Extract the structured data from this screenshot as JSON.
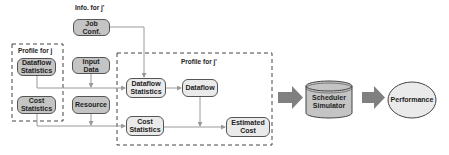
{
  "diagram": {
    "captions": {
      "info_for": "Info. for j'",
      "profile_for_j": "Profile for j",
      "profile_for_jprime": "Profile for j'"
    },
    "nodes": {
      "job_conf": "Job\nConf.",
      "dataflow_statistics_j": "Dataflow\nStatistics",
      "input_data": "Input\nData",
      "cost_statistics_j": "Cost\nStatistics",
      "resource": "Resource",
      "dataflow_statistics_jprime": "Dataflow\nStatistics",
      "dataflow": "Dataflow",
      "cost_statistics_jprime": "Cost\nStatistics",
      "estimated_cost": "Estimated\nCost",
      "scheduler_simulator": "Scheduler\nSimulator",
      "performance": "Performance"
    },
    "colors": {
      "dark_node": "#c4c4c4",
      "light_node": "#eaeaea",
      "arrow": "#9a9a9a",
      "block_arrow": "#808080",
      "border": "#555555"
    }
  }
}
